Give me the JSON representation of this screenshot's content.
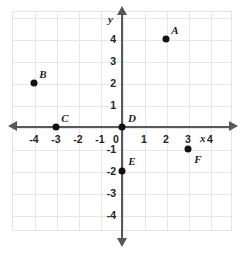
{
  "chart_data": {
    "type": "scatter",
    "title": "",
    "xlabel": "x",
    "ylabel": "y",
    "xlim": [
      -5,
      5
    ],
    "ylim": [
      -5,
      5
    ],
    "grid": true,
    "legend": false,
    "x_ticks": [
      "-4",
      "-3",
      "-2",
      "-1",
      "0",
      "1",
      "2",
      "3",
      "4"
    ],
    "x_tick_values": [
      -4,
      -3,
      -2,
      -1,
      0,
      1,
      2,
      3,
      4
    ],
    "y_ticks": [
      "4",
      "3",
      "2",
      "1",
      "-1",
      "-2",
      "-3",
      "-4"
    ],
    "y_tick_values": [
      4,
      3,
      2,
      1,
      -1,
      -2,
      -3,
      -4
    ],
    "points": [
      {
        "label": "A",
        "x": 2,
        "y": 4,
        "label_dx": 9,
        "label_dy": -9
      },
      {
        "label": "B",
        "x": -4,
        "y": 2,
        "label_dx": 9,
        "label_dy": -9
      },
      {
        "label": "C",
        "x": -3,
        "y": 0,
        "label_dx": 9,
        "label_dy": -9
      },
      {
        "label": "D",
        "x": 0,
        "y": 0,
        "label_dx": 10,
        "label_dy": -9
      },
      {
        "label": "E",
        "x": 0,
        "y": -2,
        "label_dx": 10,
        "label_dy": -10
      },
      {
        "label": "F",
        "x": 3,
        "y": -1,
        "label_dx": 10,
        "label_dy": 10
      }
    ]
  },
  "colors": {
    "axis": "#58585b",
    "grid": "#e6e6e9",
    "point": "#111111",
    "text": "#231f20",
    "background": "#ffffff"
  }
}
